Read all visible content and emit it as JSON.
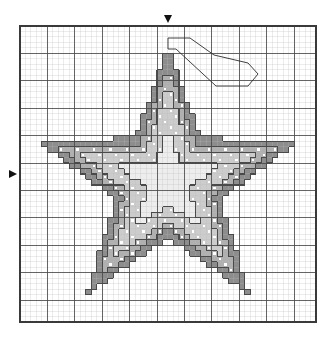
{
  "document": {
    "type": "cross-stitch-pattern-chart",
    "title": "Star Cross-Stitch Chart",
    "background_color": "#ffffff"
  },
  "grid": {
    "columns": 54,
    "rows": 54,
    "cell_size_px": 5.481,
    "origin_x_px": 20,
    "origin_y_px": 26,
    "minor_line_color": "#b9b9b9",
    "major_line_color": "#4a4a4a",
    "border_color": "#3a3a3a",
    "major_interval": 5,
    "grid_background": "#fdfdfd"
  },
  "markers": [
    {
      "name": "top-center-marker",
      "edge": "top",
      "direction": "down",
      "column": 27,
      "color": "#111111"
    },
    {
      "name": "left-center-marker",
      "edge": "left",
      "direction": "right",
      "row": 27,
      "color": "#111111"
    }
  ],
  "palette": {
    "floss_outline": "#4a4a4a",
    "shade_dark": "#8d8d8d",
    "shade_mid": "#b0b0b0",
    "shade_light": "#cccccc",
    "shade_lightest": "#ededed",
    "symbol_dot": "#ffffff",
    "backstitch": "#2b2b2b"
  },
  "legend_shades": [
    {
      "key": "shade_dark",
      "label": "dark grey",
      "hex": "#8d8d8d"
    },
    {
      "key": "shade_mid",
      "label": "medium grey",
      "hex": "#b0b0b0"
    },
    {
      "key": "shade_light",
      "label": "light grey",
      "hex": "#cccccc"
    },
    {
      "key": "shade_lightest",
      "label": "lightest grey",
      "hex": "#ededed"
    }
  ],
  "chart_data": {
    "type": "heatmap",
    "xlabel": "",
    "ylabel": "",
    "grid": true,
    "legend_position": "none",
    "x": [
      0,
      54
    ],
    "y": [
      0,
      54
    ],
    "value_map": {
      "0": "#ffffff",
      "1": "#8d8d8d",
      "2": "#b0b0b0",
      "3": "#cccccc",
      "4": "#ededed"
    },
    "stitch_regions": [
      {
        "shade": "shade_dark",
        "hex": "#8d8d8d",
        "description": "outer contour band of star"
      },
      {
        "shade": "shade_mid",
        "hex": "#b0b0b0",
        "description": "mid band between outer and inner"
      },
      {
        "shade": "shade_light",
        "hex": "#cccccc",
        "description": "broad fill of star arms"
      },
      {
        "shade": "shade_lightest",
        "hex": "#ededed",
        "description": "highlight core of star"
      }
    ],
    "star": {
      "points": 5,
      "outer_radius_cells": 25,
      "inner_radius_cells": 10,
      "center_col": 27,
      "center_row": 28.5,
      "rotation_deg": -90
    },
    "backstitch_outline": {
      "name": "banner-outline",
      "color": "#2b2b2b",
      "points_px": [
        [
          168,
          38
        ],
        [
          190,
          38
        ],
        [
          214,
          55
        ],
        [
          248,
          63
        ],
        [
          258,
          74
        ],
        [
          248,
          86
        ],
        [
          216,
          86
        ],
        [
          176,
          49
        ],
        [
          168,
          49
        ]
      ]
    }
  }
}
